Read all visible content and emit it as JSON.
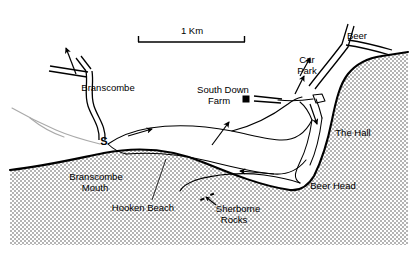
{
  "figure": {
    "type": "map",
    "background_color": "#ffffff",
    "ink_color": "#000000",
    "sea_fill_color": "#c8c8c8"
  },
  "scale_bar": {
    "label": "1 Km",
    "x_start_px": 138,
    "x_end_px": 245,
    "baseline_y_px": 42,
    "tick_height_px": 6
  },
  "labels": [
    {
      "id": "branscombe",
      "text": "Branscombe",
      "x": 108,
      "y": 88,
      "anchor": "middle"
    },
    {
      "id": "south-down-farm-1",
      "text": "South Down",
      "x": 223,
      "y": 90,
      "anchor": "middle"
    },
    {
      "id": "south-down-farm-2",
      "text": "Farm",
      "x": 219,
      "y": 101,
      "anchor": "middle"
    },
    {
      "id": "car-park-1",
      "text": "Car",
      "x": 307,
      "y": 60,
      "anchor": "middle"
    },
    {
      "id": "car-park-2",
      "text": "Park",
      "x": 307,
      "y": 71,
      "anchor": "middle"
    },
    {
      "id": "beer",
      "text": "Beer",
      "x": 357,
      "y": 36,
      "anchor": "middle"
    },
    {
      "id": "the-hall",
      "text": "The Hall",
      "x": 353,
      "y": 133,
      "anchor": "middle"
    },
    {
      "id": "beer-head",
      "text": "Beer Head",
      "x": 333,
      "y": 186,
      "anchor": "middle"
    },
    {
      "id": "branscombe-mouth-1",
      "text": "Branscombe",
      "x": 96,
      "y": 177,
      "anchor": "middle"
    },
    {
      "id": "branscombe-mouth-2",
      "text": "Mouth",
      "x": 95,
      "y": 188,
      "anchor": "middle"
    },
    {
      "id": "hooken-beach",
      "text": "Hooken Beach",
      "x": 143,
      "y": 208,
      "anchor": "middle"
    },
    {
      "id": "sherborne-rocks-1",
      "text": "Sherborne",
      "x": 238,
      "y": 209,
      "anchor": "middle"
    },
    {
      "id": "sherborne-rocks-2",
      "text": "Rocks",
      "x": 234,
      "y": 220,
      "anchor": "middle"
    }
  ],
  "point_markers": [
    {
      "id": "south-down-farm-marker",
      "kind": "filled-square",
      "x": 246,
      "y": 99,
      "size": 7
    },
    {
      "id": "slipway-marker",
      "kind": "letter",
      "x": 104,
      "y": 142,
      "text": "S"
    }
  ],
  "annotation_arrows": [
    {
      "id": "north-arrow",
      "desc": "arrow pointing up-left from Branscombe road junction"
    },
    {
      "id": "undercliff-arrow-west",
      "desc": "arrow on undercliff pointing east-north-east"
    },
    {
      "id": "undercliff-arrow-east",
      "desc": "arrow on lower undercliff pointing west"
    },
    {
      "id": "south-down-farm-arrow",
      "desc": "arrow pointing up-right toward South Down Farm track"
    },
    {
      "id": "beer-road-arrow-upper",
      "desc": "arrow on Beer road pointing north"
    },
    {
      "id": "beer-road-arrow-lower",
      "desc": "arrow on Beer road pointing north"
    },
    {
      "id": "beer-head-path-arrow",
      "desc": "arrow on coast path pointing south toward Beer Head"
    },
    {
      "id": "sherborne-rocks-pointer",
      "desc": "short arrow pointing up-left to the Sherborne Rocks marks"
    }
  ]
}
